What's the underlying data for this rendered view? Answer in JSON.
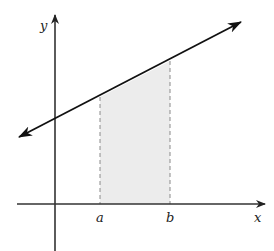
{
  "diagram": {
    "type": "definite-integral-area",
    "axes": {
      "x_label": "x",
      "y_label": "y"
    },
    "bounds": {
      "a_label": "a",
      "b_label": "b"
    },
    "colors": {
      "line": "#1a1a1a",
      "axis": "#333333",
      "shading": "#ececec",
      "dashed": "#888888"
    }
  }
}
